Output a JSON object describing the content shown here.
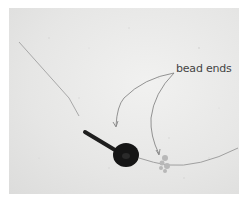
{
  "image": {
    "description": "Photograph of a black bead threaded on a fine wire with a crimp tube and a frayed knot, on a textured light grey background",
    "annotation": {
      "label": "bead ends",
      "arrow_count": 2
    },
    "colors": {
      "background": "#e6e6e5",
      "border": "#ffffff",
      "bead": "#151515",
      "wire": "#9a9a9a",
      "annotation_text": "#444444",
      "annotation_arrow": "#7a7a7a"
    }
  }
}
